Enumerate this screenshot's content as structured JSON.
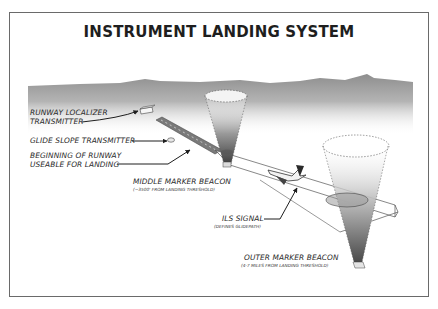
{
  "diagram": {
    "title": "INSTRUMENT LANDING SYSTEM",
    "labels": {
      "localizer_line1": "RUNWAY LOCALIZER",
      "localizer_line2": "TRANSMITTER",
      "glide_slope": "GLIDE SLOPE TRANSMITTER",
      "runway_begin_line1": "BEGINNING OF RUNWAY",
      "runway_begin_line2": "USEABLE FOR LANDING",
      "middle_marker": "MIDDLE MARKER BEACON",
      "middle_marker_note": "(~3500' FROM LANDING THRESHOLD)",
      "ils_signal": "ILS SIGNAL",
      "ils_signal_note": "(DEFINES GLIDEPATH)",
      "outer_marker": "OUTER MARKER BEACON",
      "outer_marker_note": "(4-7 MILES FROM LANDING THRESHOLD)"
    },
    "elements": [
      "horizon-hills",
      "runway",
      "localizer-transmitter",
      "glide-slope-transmitter",
      "middle-marker-cone",
      "outer-marker-cone",
      "ils-glidepath-beam",
      "airplane"
    ],
    "colors": {
      "frame": "#6a6a6a",
      "sky_band": "#9a9a9a",
      "text": "#2a2a2a",
      "runway": "#8a8a8a",
      "cone_dark": "#4a4a4a"
    }
  }
}
